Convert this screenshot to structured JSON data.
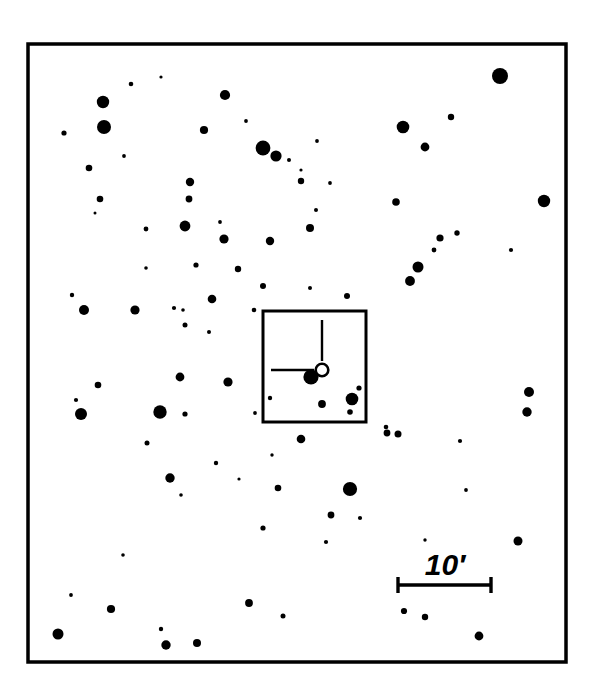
{
  "figure": {
    "kind": "astronomical-finder-chart",
    "background_color": "#ffffff",
    "ink_color": "#000000",
    "width": 593,
    "height": 697
  },
  "outer_frame": {
    "name": "field-of-view-frame",
    "x": 28,
    "y": 44,
    "width": 538,
    "height": 618,
    "stroke_width": 3.5
  },
  "inner_box": {
    "name": "zoom-region-box",
    "x": 263,
    "y": 311,
    "width": 103,
    "height": 111,
    "stroke_width": 3
  },
  "target_marker": {
    "name": "target-object-marker",
    "circle": {
      "cx": 322,
      "cy": 370,
      "r": 6.3,
      "stroke_width": 2.6,
      "filled": false
    },
    "tick_vertical": {
      "x": 322,
      "y1": 320,
      "y2": 361,
      "stroke_width": 2.4
    },
    "tick_horizontal": {
      "y": 370,
      "x1": 271,
      "x2": 314,
      "stroke_width": 2.4
    }
  },
  "scale_bar": {
    "name": "angular-scale-bar",
    "label": "10′",
    "label_x": 445,
    "label_y": 575,
    "x1": 398,
    "x2": 491,
    "y": 585,
    "stroke_width": 3.4,
    "cap_half_height": 8
  },
  "chart_data": {
    "type": "scatter",
    "title": "",
    "xlabel": "",
    "ylabel": "",
    "grid": false,
    "legend": null,
    "annotations": [
      "10′"
    ],
    "point_encoding": "marker radius encodes stellar brightness (magnitude); larger = brighter",
    "xlim": [
      28,
      566
    ],
    "ylim": [
      44,
      662
    ],
    "stars": [
      {
        "x": 103,
        "y": 102,
        "r": 6.2
      },
      {
        "x": 131,
        "y": 84,
        "r": 2.3
      },
      {
        "x": 161,
        "y": 77,
        "r": 1.6
      },
      {
        "x": 104,
        "y": 127,
        "r": 7.0
      },
      {
        "x": 225,
        "y": 95,
        "r": 5.1
      },
      {
        "x": 204,
        "y": 130,
        "r": 4.1
      },
      {
        "x": 246,
        "y": 121,
        "r": 1.9
      },
      {
        "x": 263,
        "y": 148,
        "r": 7.4
      },
      {
        "x": 276,
        "y": 156,
        "r": 5.6
      },
      {
        "x": 289,
        "y": 160,
        "r": 2.0
      },
      {
        "x": 301,
        "y": 170,
        "r": 1.6
      },
      {
        "x": 317,
        "y": 141,
        "r": 1.9
      },
      {
        "x": 403,
        "y": 127,
        "r": 6.3
      },
      {
        "x": 425,
        "y": 147,
        "r": 4.4
      },
      {
        "x": 451,
        "y": 117,
        "r": 3.2
      },
      {
        "x": 500,
        "y": 76,
        "r": 8.0
      },
      {
        "x": 544,
        "y": 201,
        "r": 6.2
      },
      {
        "x": 64,
        "y": 133,
        "r": 2.6
      },
      {
        "x": 89,
        "y": 168,
        "r": 3.3
      },
      {
        "x": 124,
        "y": 156,
        "r": 1.9
      },
      {
        "x": 100,
        "y": 199,
        "r": 3.3
      },
      {
        "x": 95,
        "y": 213,
        "r": 1.5
      },
      {
        "x": 190,
        "y": 182,
        "r": 4.2
      },
      {
        "x": 189,
        "y": 199,
        "r": 3.4
      },
      {
        "x": 220,
        "y": 222,
        "r": 1.9
      },
      {
        "x": 224,
        "y": 239,
        "r": 4.6
      },
      {
        "x": 270,
        "y": 241,
        "r": 4.2
      },
      {
        "x": 301,
        "y": 181,
        "r": 3.2
      },
      {
        "x": 330,
        "y": 183,
        "r": 1.9
      },
      {
        "x": 310,
        "y": 228,
        "r": 4.0
      },
      {
        "x": 396,
        "y": 202,
        "r": 3.8
      },
      {
        "x": 440,
        "y": 238,
        "r": 3.6
      },
      {
        "x": 457,
        "y": 233,
        "r": 2.7
      },
      {
        "x": 434,
        "y": 250,
        "r": 2.4
      },
      {
        "x": 410,
        "y": 281,
        "r": 4.9
      },
      {
        "x": 418,
        "y": 267,
        "r": 5.5
      },
      {
        "x": 511,
        "y": 250,
        "r": 2.1
      },
      {
        "x": 146,
        "y": 229,
        "r": 2.4
      },
      {
        "x": 72,
        "y": 295,
        "r": 2.2
      },
      {
        "x": 84,
        "y": 310,
        "r": 5.0
      },
      {
        "x": 185,
        "y": 226,
        "r": 5.4
      },
      {
        "x": 196,
        "y": 265,
        "r": 2.6
      },
      {
        "x": 212,
        "y": 299,
        "r": 4.3
      },
      {
        "x": 174,
        "y": 308,
        "r": 2.1
      },
      {
        "x": 185,
        "y": 325,
        "r": 2.5
      },
      {
        "x": 183,
        "y": 310,
        "r": 1.8
      },
      {
        "x": 135,
        "y": 310,
        "r": 4.6
      },
      {
        "x": 254,
        "y": 310,
        "r": 2.3
      },
      {
        "x": 316,
        "y": 210,
        "r": 2.0
      },
      {
        "x": 238,
        "y": 269,
        "r": 3.2
      },
      {
        "x": 263,
        "y": 286,
        "r": 3.0
      },
      {
        "x": 311,
        "y": 377,
        "r": 7.6
      },
      {
        "x": 322,
        "y": 404,
        "r": 3.9
      },
      {
        "x": 352,
        "y": 399,
        "r": 6.3
      },
      {
        "x": 359,
        "y": 388,
        "r": 2.6
      },
      {
        "x": 350,
        "y": 412,
        "r": 2.8
      },
      {
        "x": 386,
        "y": 427,
        "r": 2.3
      },
      {
        "x": 387,
        "y": 433,
        "r": 3.4
      },
      {
        "x": 398,
        "y": 434,
        "r": 3.5
      },
      {
        "x": 301,
        "y": 439,
        "r": 4.3
      },
      {
        "x": 460,
        "y": 441,
        "r": 2.1
      },
      {
        "x": 529,
        "y": 392,
        "r": 5.0
      },
      {
        "x": 527,
        "y": 412,
        "r": 4.7
      },
      {
        "x": 98,
        "y": 385,
        "r": 3.3
      },
      {
        "x": 76,
        "y": 400,
        "r": 2.1
      },
      {
        "x": 81,
        "y": 414,
        "r": 6.0
      },
      {
        "x": 160,
        "y": 412,
        "r": 6.7
      },
      {
        "x": 180,
        "y": 377,
        "r": 4.4
      },
      {
        "x": 185,
        "y": 414,
        "r": 2.6
      },
      {
        "x": 228,
        "y": 382,
        "r": 4.6
      },
      {
        "x": 255,
        "y": 413,
        "r": 1.9
      },
      {
        "x": 270,
        "y": 398,
        "r": 2.2
      },
      {
        "x": 147,
        "y": 443,
        "r": 2.5
      },
      {
        "x": 216,
        "y": 463,
        "r": 2.2
      },
      {
        "x": 239,
        "y": 479,
        "r": 1.6
      },
      {
        "x": 170,
        "y": 478,
        "r": 4.7
      },
      {
        "x": 181,
        "y": 495,
        "r": 1.8
      },
      {
        "x": 272,
        "y": 455,
        "r": 1.7
      },
      {
        "x": 278,
        "y": 488,
        "r": 3.3
      },
      {
        "x": 350,
        "y": 489,
        "r": 7.1
      },
      {
        "x": 331,
        "y": 515,
        "r": 3.4
      },
      {
        "x": 360,
        "y": 518,
        "r": 2.1
      },
      {
        "x": 263,
        "y": 528,
        "r": 2.6
      },
      {
        "x": 326,
        "y": 542,
        "r": 2.1
      },
      {
        "x": 425,
        "y": 540,
        "r": 1.7
      },
      {
        "x": 123,
        "y": 555,
        "r": 1.8
      },
      {
        "x": 71,
        "y": 595,
        "r": 1.9
      },
      {
        "x": 111,
        "y": 609,
        "r": 4.1
      },
      {
        "x": 58,
        "y": 634,
        "r": 5.5
      },
      {
        "x": 161,
        "y": 629,
        "r": 2.2
      },
      {
        "x": 166,
        "y": 645,
        "r": 4.7
      },
      {
        "x": 197,
        "y": 643,
        "r": 4.0
      },
      {
        "x": 249,
        "y": 603,
        "r": 3.9
      },
      {
        "x": 283,
        "y": 616,
        "r": 2.5
      },
      {
        "x": 404,
        "y": 611,
        "r": 3.1
      },
      {
        "x": 425,
        "y": 617,
        "r": 3.2
      },
      {
        "x": 479,
        "y": 636,
        "r": 4.4
      },
      {
        "x": 518,
        "y": 541,
        "r": 4.5
      },
      {
        "x": 466,
        "y": 490,
        "r": 1.9
      },
      {
        "x": 209,
        "y": 332,
        "r": 2.0
      },
      {
        "x": 146,
        "y": 268,
        "r": 1.8
      },
      {
        "x": 347,
        "y": 296,
        "r": 3.0
      },
      {
        "x": 310,
        "y": 288,
        "r": 2.0
      }
    ]
  }
}
